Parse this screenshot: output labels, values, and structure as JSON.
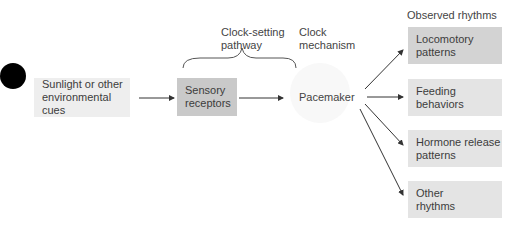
{
  "diagram": {
    "marker": {
      "color": "#000000"
    },
    "nodes": {
      "cues": {
        "label": "Sunlight or other\nenvironmental cues",
        "color": "#eeeeee"
      },
      "receptors": {
        "label": "Sensory\nreceptors",
        "color": "#c9c9c9"
      },
      "pacemaker": {
        "label": "Pacemaker",
        "color": "#f7f7f7"
      },
      "locomotory": {
        "label": "Locomotory\npatterns",
        "color": "#d3d3d3"
      },
      "feeding": {
        "label": "Feeding\nbehaviors",
        "color": "#e4e4e4"
      },
      "hormone": {
        "label": "Hormone release\npatterns",
        "color": "#e4e4e4"
      },
      "other": {
        "label": "Other\nrhythms",
        "color": "#e4e4e4"
      }
    },
    "headings": {
      "clock_setting": "Clock-setting\npathway",
      "clock_mechanism": "Clock\nmechanism",
      "observed": "Observed rhythms"
    }
  }
}
